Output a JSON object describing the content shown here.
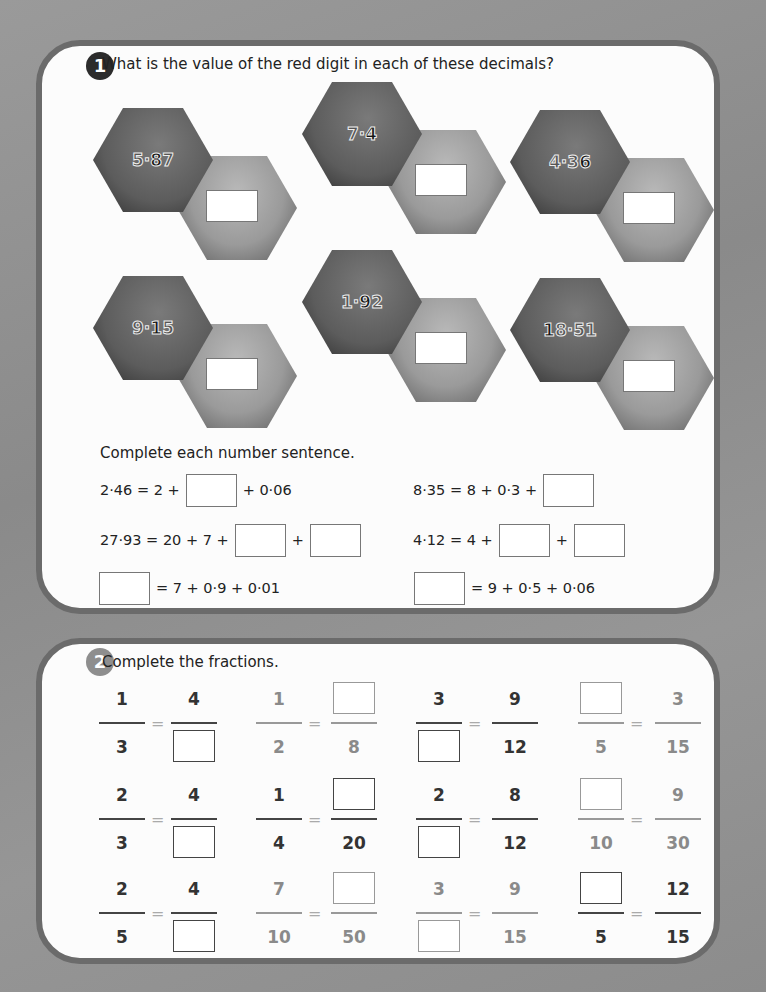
{
  "question1": {
    "badge": "1",
    "prompt": "What is the value of the red digit in each of these decimals?",
    "hexagons": [
      {
        "before": "5·",
        "red": "8",
        "after": "7",
        "value": "5·87",
        "red_digit": "8"
      },
      {
        "before": "7·",
        "red": "4",
        "after": "",
        "value": "7·4",
        "red_digit": "4"
      },
      {
        "before": "4·3",
        "red": "6",
        "after": "",
        "value": "4·36",
        "red_digit": "6"
      },
      {
        "before": "9·",
        "red": "1",
        "after": "5",
        "value": "9·15",
        "red_digit": "1"
      },
      {
        "before": "1·",
        "red": "9",
        "after": "2",
        "value": "1·92",
        "red_digit": "9"
      },
      {
        "before": "",
        "red": "1",
        "after": "8·51",
        "value": "18·51",
        "red_digit": "1"
      }
    ],
    "sentences_heading": "Complete each number sentence.",
    "sentences": {
      "s1": {
        "a": "2·46 = 2 +",
        "b": "+ 0·06"
      },
      "s2": {
        "a": "8·35 = 8 + 0·3 +"
      },
      "s3": {
        "a": "27·93 = 20 + 7 +",
        "b": "+"
      },
      "s4": {
        "a": "4·12 = 4 +",
        "b": "+"
      },
      "s5": {
        "b": "= 7 + 0·9 + 0·01"
      },
      "s6": {
        "b": "= 9 + 0·5 + 0·06"
      }
    }
  },
  "question2": {
    "badge": "2",
    "prompt": "Complete the fractions.",
    "equals": "=",
    "rows": [
      [
        {
          "n1": "1",
          "d1": "3",
          "n2": "4",
          "d2": ""
        },
        {
          "n1": "1",
          "d1": "2",
          "n2": "",
          "d2": "8"
        },
        {
          "n1": "3",
          "d1": "",
          "n2": "9",
          "d2": "12"
        },
        {
          "n1": "",
          "d1": "5",
          "n2": "3",
          "d2": "15"
        }
      ],
      [
        {
          "n1": "2",
          "d1": "3",
          "n2": "4",
          "d2": ""
        },
        {
          "n1": "1",
          "d1": "4",
          "n2": "",
          "d2": "20"
        },
        {
          "n1": "2",
          "d1": "",
          "n2": "8",
          "d2": "12"
        },
        {
          "n1": "",
          "d1": "10",
          "n2": "9",
          "d2": "30"
        }
      ],
      [
        {
          "n1": "2",
          "d1": "5",
          "n2": "4",
          "d2": ""
        },
        {
          "n1": "7",
          "d1": "10",
          "n2": "",
          "d2": "50"
        },
        {
          "n1": "3",
          "d1": "",
          "n2": "9",
          "d2": "15"
        },
        {
          "n1": "",
          "d1": "5",
          "n2": "12",
          "d2": "15"
        }
      ]
    ]
  }
}
